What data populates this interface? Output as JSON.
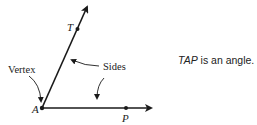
{
  "diagram": {
    "labels": {
      "vertex_point": "A",
      "point_t": "T",
      "point_p": "P",
      "vertex_callout": "Vertex",
      "sides_callout": "Sides"
    },
    "caption": {
      "angle_name": "TAP",
      "text": " is an angle."
    },
    "colors": {
      "line": "#1a1a1a",
      "text": "#222222"
    }
  }
}
